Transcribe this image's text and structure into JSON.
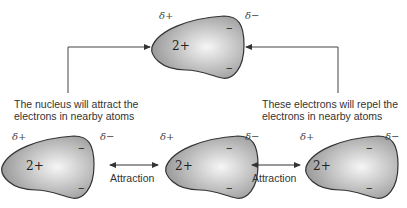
{
  "atoms": [
    {
      "id": "top",
      "x": 144,
      "y": 10,
      "charge": "2+",
      "delta_plus": "δ+",
      "delta_minus": "δ−",
      "electrons": [
        "−",
        "−"
      ]
    },
    {
      "id": "left",
      "x": 0,
      "y": 130,
      "charge": "2+",
      "delta_plus": "δ+",
      "delta_minus": "δ−",
      "electrons": [
        "−",
        "−"
      ]
    },
    {
      "id": "middle",
      "x": 164,
      "y": 130,
      "charge": "2+",
      "delta_plus": "δ+",
      "delta_minus": "δ−",
      "electrons": [
        "−",
        "−"
      ]
    },
    {
      "id": "right",
      "x": 304,
      "y": 130,
      "charge": "2+",
      "delta_plus": "δ+",
      "delta_minus": "δ−",
      "electrons": [
        "−",
        "−"
      ]
    }
  ],
  "captions": {
    "left_line1": "The nucleus will attract the",
    "left_line2": "electrons in nearby atoms",
    "right_line1": "These electrons will repel the",
    "right_line2": "electrons in nearby atoms"
  },
  "attraction_labels": [
    "Attraction",
    "Attraction"
  ],
  "colors": {
    "line": "#444444",
    "atom_fill_center": "#f4f4f4",
    "atom_fill_edge": "#9a9a9a",
    "atom_stroke": "#333333"
  }
}
